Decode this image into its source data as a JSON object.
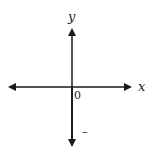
{
  "diagram": {
    "type": "coordinate-axes",
    "x_axis_label": "x",
    "y_axis_label": "y",
    "origin_label": "0",
    "tick_mark_label": "–",
    "colors": {
      "axis": "#1a1a1a",
      "background": "#ffffff"
    }
  }
}
